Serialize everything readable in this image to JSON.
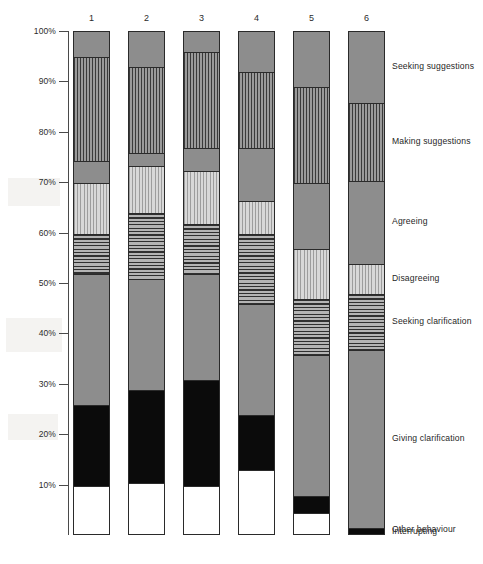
{
  "chart_data": {
    "type": "bar",
    "subtype": "stacked-100-percent",
    "title": "",
    "xlabel": "",
    "ylabel": "",
    "ylim": [
      0,
      100
    ],
    "y_unit": "%",
    "grid": false,
    "legend_position": "right",
    "categories": [
      "1",
      "2",
      "3",
      "4",
      "5",
      "6"
    ],
    "tick_labels": [
      "100%",
      "90%",
      "80%",
      "70%",
      "60%",
      "50%",
      "40%",
      "30%",
      "20%",
      "10%"
    ],
    "tick_values": [
      100,
      90,
      80,
      70,
      60,
      50,
      40,
      30,
      20,
      10
    ],
    "series": [
      {
        "name": "Seeking suggestions",
        "pattern": "solid-gray",
        "color": "#8d8d8d",
        "values": [
          5.0,
          7.0,
          4.0,
          8.0,
          11.0,
          14.0
        ]
      },
      {
        "name": "Making suggestions",
        "pattern": "vertical-stripes",
        "color": "#3a3a3a",
        "values": [
          20.5,
          17.0,
          19.0,
          15.0,
          19.0,
          15.5
        ]
      },
      {
        "name": "Agreeing",
        "pattern": "solid-gray",
        "color": "#8d8d8d",
        "values": [
          4.5,
          2.5,
          4.5,
          10.5,
          13.0,
          16.5
        ]
      },
      {
        "name": "Disagreeing",
        "pattern": "light-vertical-stripes",
        "color": "#c6c6c6",
        "values": [
          10.0,
          9.5,
          10.5,
          6.5,
          10.0,
          6.0
        ]
      },
      {
        "name": "Seeking clarification",
        "pattern": "horizontal-lines",
        "color": "#8f8f8f",
        "values": [
          8.0,
          13.0,
          10.0,
          14.0,
          11.0,
          11.0
        ]
      },
      {
        "name": "Giving clarification",
        "pattern": "solid-gray",
        "color": "#8d8d8d",
        "values": [
          26.0,
          22.0,
          21.0,
          22.0,
          28.0,
          35.5
        ]
      },
      {
        "name": "Interrupting",
        "pattern": "solid-black",
        "color": "#0b0b0b",
        "values": [
          16.0,
          18.5,
          21.0,
          11.0,
          3.5,
          1.5
        ]
      },
      {
        "name": "Other behaviour",
        "pattern": "white",
        "color": "#ffffff",
        "values": [
          10.0,
          10.5,
          10.0,
          13.0,
          4.5,
          0.0
        ]
      }
    ],
    "legend_entries": [
      "Seeking suggestions",
      "Making suggestions",
      "Agreeing",
      "Disagreeing",
      "Seeking clarification",
      "Giving clarification",
      "Interrupting",
      "Other behaviour"
    ]
  }
}
